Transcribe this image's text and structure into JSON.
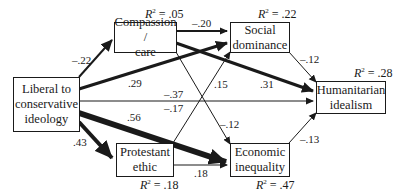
{
  "nodes": {
    "ideology": {
      "line1": "Liberal to",
      "line2": "conservative",
      "line3": "ideology"
    },
    "compassion": {
      "line1": "Compassion /",
      "line2": "care",
      "r2_label": "R",
      "r2_sup": "2",
      "r2_value": " = .05"
    },
    "social_dominance": {
      "line1": "Social",
      "line2": "dominance",
      "r2_label": "R",
      "r2_sup": "2",
      "r2_value": " = .22"
    },
    "humanitarian": {
      "line1": "Humanitarian",
      "line2": "idealism",
      "r2_label": "R",
      "r2_sup": "2",
      "r2_value": " = .28"
    },
    "protestant": {
      "line1": "Protestant",
      "line2": "ethic",
      "r2_label": "R",
      "r2_sup": "2",
      "r2_value": " = .18"
    },
    "economic": {
      "line1": "Economic",
      "line2": "inequality",
      "r2_label": "R",
      "r2_sup": "2",
      "r2_value": " = .47"
    }
  },
  "paths": [
    {
      "from": "Liberal to conservative ideology",
      "to": "Compassion / care",
      "coef": "–.22"
    },
    {
      "from": "Liberal to conservative ideology",
      "to": "Social dominance",
      "coef": ".29"
    },
    {
      "from": "Liberal to conservative ideology",
      "to": "Humanitarian idealism",
      "coef": "–.37"
    },
    {
      "from": "Liberal to conservative ideology",
      "to": "Economic inequality",
      "coef": ".56"
    },
    {
      "from": "Liberal to conservative ideology",
      "to": "Protestant ethic",
      "coef": ".43"
    },
    {
      "from": "Compassion / care",
      "to": "Social dominance",
      "coef": "–.20"
    },
    {
      "from": "Compassion / care",
      "to": "Humanitarian idealism",
      "coef": ".31"
    },
    {
      "from": "Compassion / care",
      "to": "Economic inequality",
      "coef": "–.12"
    },
    {
      "from": "Protestant ethic",
      "to": "Social dominance",
      "coef": ".15"
    },
    {
      "from": "Protestant ethic",
      "to": "Humanitarian idealism",
      "coef": "–.17"
    },
    {
      "from": "Protestant ethic",
      "to": "Economic inequality",
      "coef": ".18"
    },
    {
      "from": "Social dominance",
      "to": "Humanitarian idealism",
      "coef": "–.12"
    },
    {
      "from": "Economic inequality",
      "to": "Humanitarian idealism",
      "coef": "–.13"
    }
  ],
  "colors": {
    "stroke": "#1a1a1a",
    "background": "#ffffff"
  }
}
